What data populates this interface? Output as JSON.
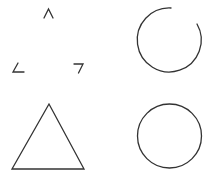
{
  "diagram": {
    "title": "",
    "stroke_color": "#333333",
    "background": "#ffffff",
    "shapes": [
      {
        "id": "illusory-triangle",
        "type": "triangle-corners",
        "description": "Three disconnected corner segments forming an implied triangle"
      },
      {
        "id": "incomplete-circle",
        "type": "arc",
        "description": "Circle with a gap at the upper right"
      },
      {
        "id": "complete-triangle",
        "type": "triangle",
        "description": "Closed outline triangle"
      },
      {
        "id": "complete-circle",
        "type": "circle",
        "description": "Closed outline circle"
      }
    ]
  }
}
